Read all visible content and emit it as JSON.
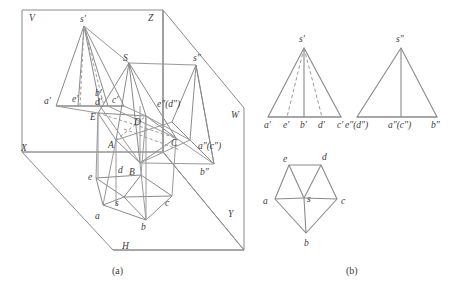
{
  "figure": {
    "stroke_color": "#8a8a8a",
    "dash_color": "#9a9a9a",
    "label_color": "#3b3b3b",
    "background": "#ffffff",
    "captions": [
      {
        "id": "cap_a",
        "text": "(a)",
        "x": 118,
        "y": 271
      },
      {
        "id": "cap_b",
        "text": "(b)",
        "x": 352,
        "y": 271
      }
    ]
  },
  "panel_a": {
    "name": "pictorial-three-plane-projection",
    "plane_labels": [
      {
        "id": "V",
        "text": "V",
        "x": 29,
        "y": 17
      },
      {
        "id": "Z",
        "text": "Z",
        "x": 148,
        "y": 17
      },
      {
        "id": "W",
        "text": "W",
        "x": 231,
        "y": 115
      },
      {
        "id": "X",
        "text": "X",
        "x": 21,
        "y": 148
      },
      {
        "id": "H",
        "text": "H",
        "x": 122,
        "y": 246
      },
      {
        "id": "Y",
        "text": "Y",
        "x": 228,
        "y": 214
      }
    ],
    "v_projection_labels": [
      {
        "id": "s_p",
        "text": "s′",
        "x": 84,
        "y": 17
      },
      {
        "id": "a_p",
        "text": "a′",
        "x": 46,
        "y": 101
      },
      {
        "id": "e_p",
        "text": "e′",
        "x": 74,
        "y": 98
      },
      {
        "id": "b_p",
        "text": "b′",
        "x": 96,
        "y": 93
      },
      {
        "id": "d_p",
        "text": "d′",
        "x": 96,
        "y": 102
      },
      {
        "id": "c_p",
        "text": "c′",
        "x": 114,
        "y": 100
      }
    ],
    "w_projection_labels": [
      {
        "id": "s_pp",
        "text": "s″",
        "x": 196,
        "y": 57
      },
      {
        "id": "ed_pp",
        "text": "e″(d″)",
        "x": 159,
        "y": 104
      },
      {
        "id": "ac_pp",
        "text": "a″(c″)",
        "x": 200,
        "y": 146
      },
      {
        "id": "b_pp",
        "text": "b″",
        "x": 202,
        "y": 172
      }
    ],
    "solid_labels": [
      {
        "id": "S",
        "text": "S",
        "x": 124,
        "y": 58
      },
      {
        "id": "E",
        "text": "E",
        "x": 91,
        "y": 117
      },
      {
        "id": "D",
        "text": "D",
        "x": 135,
        "y": 122
      },
      {
        "id": "A",
        "text": "A",
        "x": 109,
        "y": 145
      },
      {
        "id": "B",
        "text": "B",
        "x": 130,
        "y": 172
      },
      {
        "id": "C",
        "text": "C",
        "x": 172,
        "y": 143
      }
    ],
    "h_projection_labels": [
      {
        "id": "e",
        "text": "e",
        "x": 88,
        "y": 177
      },
      {
        "id": "d",
        "text": "d",
        "x": 119,
        "y": 170
      },
      {
        "id": "a",
        "text": "a",
        "x": 96,
        "y": 216
      },
      {
        "id": "s",
        "text": "s",
        "x": 116,
        "y": 203
      },
      {
        "id": "b",
        "text": "b",
        "x": 142,
        "y": 227
      },
      {
        "id": "c",
        "text": "c",
        "x": 166,
        "y": 203
      }
    ]
  },
  "panel_b": {
    "name": "orthographic-three-view",
    "front_view": {
      "name": "front-view-triangle",
      "apex_label": {
        "id": "s_p",
        "text": "s′",
        "x": 298,
        "y": 37
      },
      "base_labels": [
        {
          "id": "a_p",
          "text": "a′",
          "x": 269,
          "y": 125
        },
        {
          "id": "e_p",
          "text": "e′",
          "x": 287,
          "y": 125
        },
        {
          "id": "b_p",
          "text": "b′",
          "x": 304,
          "y": 125
        },
        {
          "id": "d_p",
          "text": "d′",
          "x": 321,
          "y": 125
        },
        {
          "id": "c_p",
          "text": "c′",
          "x": 339,
          "y": 125
        }
      ]
    },
    "side_view": {
      "name": "side-view-triangle",
      "apex_label": {
        "id": "s_pp",
        "text": "s″",
        "x": 396,
        "y": 37
      },
      "base_labels": [
        {
          "id": "ed_pp",
          "text": "e″(d″)",
          "x": 355,
          "y": 125
        },
        {
          "id": "ac_pp",
          "text": "a″(c″)",
          "x": 398,
          "y": 125
        },
        {
          "id": "b_pp",
          "text": "b″",
          "x": 434,
          "y": 125
        }
      ]
    },
    "top_view": {
      "name": "top-view-pentagon",
      "labels": [
        {
          "id": "e",
          "text": "e",
          "x": 283,
          "y": 160
        },
        {
          "id": "d",
          "text": "d",
          "x": 323,
          "y": 158
        },
        {
          "id": "a",
          "text": "a",
          "x": 264,
          "y": 205
        },
        {
          "id": "s",
          "text": "s",
          "x": 308,
          "y": 201
        },
        {
          "id": "c",
          "text": "c",
          "x": 340,
          "y": 205
        },
        {
          "id": "b",
          "text": "b",
          "x": 305,
          "y": 243
        }
      ]
    }
  }
}
